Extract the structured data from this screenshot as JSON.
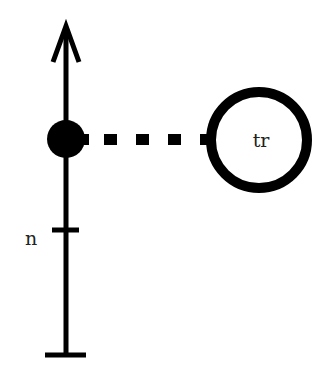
{
  "diagram": {
    "type": "feynman-style vertex diagram",
    "colors": {
      "stroke": "#000000",
      "background": "#ffffff",
      "text": "#222222"
    },
    "axis": {
      "direction": "up",
      "arrow": "arrow-up-icon",
      "tick_label": "n",
      "end_cap": "flat-bar"
    },
    "vertex": {
      "style": "filled-circle"
    },
    "connector": {
      "style": "dashed-line"
    },
    "node": {
      "style": "hollow-ring",
      "label": "tr"
    }
  }
}
